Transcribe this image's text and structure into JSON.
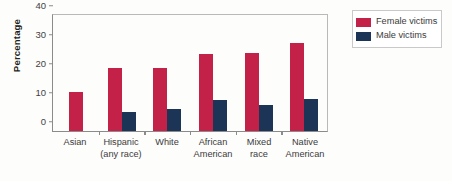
{
  "chart_data": {
    "type": "bar",
    "title": "",
    "xlabel": "",
    "ylabel": "Percentage",
    "ylim": [
      0,
      40
    ],
    "yticks": [
      0,
      10,
      20,
      30,
      40
    ],
    "ytick_labels": [
      "0",
      "10",
      "20",
      "30",
      "40"
    ],
    "grid": false,
    "legend_position": "top-right",
    "categories": [
      "Asian",
      "Hispanic (any race)",
      "White",
      "African American",
      "Mixed race",
      "Native American"
    ],
    "category_lines": [
      [
        "Asian",
        ""
      ],
      [
        "Hispanic",
        "(any race)"
      ],
      [
        "White",
        ""
      ],
      [
        "African",
        "American"
      ],
      [
        "Mixed",
        "race"
      ],
      [
        "Native",
        "American"
      ]
    ],
    "series": [
      {
        "name": "Female victims",
        "color": "#c32148",
        "values": [
          13.6,
          21.7,
          21.6,
          26.5,
          26.8,
          30.5
        ]
      },
      {
        "name": "Male victims",
        "color": "#1c3557",
        "values": [
          0,
          6.5,
          7.6,
          10.8,
          8.8,
          11.2
        ]
      }
    ]
  },
  "legend": {
    "items": [
      {
        "label": "Female victims",
        "color": "#c32148"
      },
      {
        "label": "Male victims",
        "color": "#1c3557"
      }
    ]
  },
  "colors": {
    "female": "#c32148",
    "male": "#1c3557",
    "axis": "#8b8b8b",
    "text": "#3b3b3b",
    "background": "#fdfdfb"
  }
}
